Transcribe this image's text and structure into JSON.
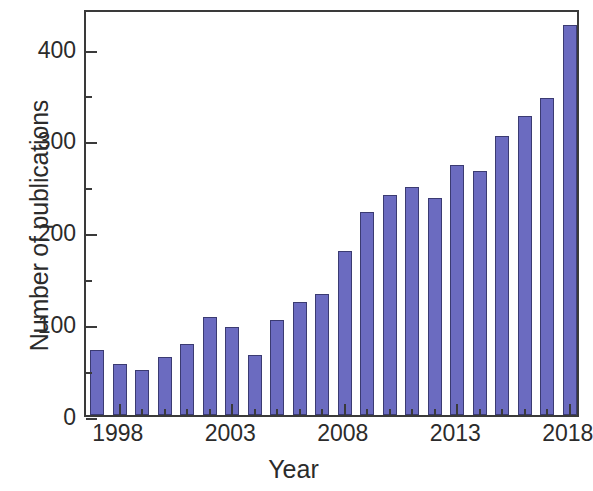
{
  "chart_data": {
    "type": "bar",
    "title": "",
    "xlabel": "Year",
    "ylabel": "Number of publications",
    "categories": [
      1997,
      1998,
      1999,
      2000,
      2001,
      2002,
      2003,
      2004,
      2005,
      2006,
      2007,
      2008,
      2009,
      2010,
      2011,
      2012,
      2013,
      2014,
      2015,
      2016,
      2017,
      2018
    ],
    "values": [
      71,
      55,
      49,
      63,
      77,
      107,
      96,
      65,
      103,
      123,
      132,
      179,
      221,
      240,
      248,
      236,
      272,
      266,
      304,
      325,
      345,
      424
    ],
    "series": [
      {
        "name": "Number of publications",
        "values": [
          71,
          55,
          49,
          63,
          77,
          107,
          96,
          65,
          103,
          123,
          132,
          179,
          221,
          240,
          248,
          236,
          272,
          266,
          304,
          325,
          345,
          424
        ]
      }
    ],
    "xlim": [
      1996.5,
      2018.5
    ],
    "ylim": [
      0,
      443
    ],
    "yticks": [
      0,
      100,
      200,
      300,
      400
    ],
    "ytick_labels": [
      "0",
      "100",
      "200",
      "300",
      "400"
    ],
    "yticks_minor": [
      50,
      150,
      250,
      350
    ],
    "xticks": [
      1998,
      2003,
      2008,
      2013,
      2018
    ],
    "xtick_labels": [
      "1998",
      "2003",
      "2008",
      "2013",
      "2018"
    ],
    "xticks_minor": [
      1999,
      2000,
      2001,
      2002,
      2004,
      2005,
      2006,
      2007,
      2009,
      2010,
      2011,
      2012,
      2014,
      2015,
      2016,
      2017
    ],
    "grid": false,
    "legend": "none",
    "bar_color": "#6b6bc0",
    "bar_edge_color": "#3b3b72",
    "axis_color": "#3a3a3a",
    "background": "#ffffff"
  }
}
